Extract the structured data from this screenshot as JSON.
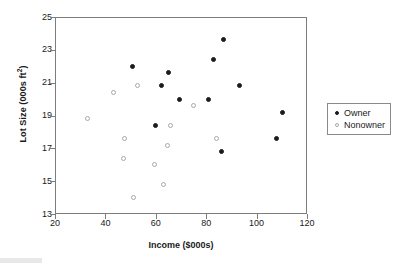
{
  "chart_data": {
    "type": "scatter",
    "title": "",
    "xlabel": "Income ($000s)",
    "ylabel": "Lot Size (000s ft²)",
    "ylabel_main": "Lot Size (000s ft",
    "ylabel_sup": "2",
    "ylabel_tail": ")",
    "xlim": [
      20,
      120
    ],
    "ylim": [
      13,
      25
    ],
    "xticks": [
      20,
      40,
      60,
      80,
      100,
      120
    ],
    "yticks": [
      13,
      15,
      17,
      19,
      21,
      23,
      25
    ],
    "grid": false,
    "legend_position": "right-outside",
    "series": [
      {
        "name": "Owner",
        "marker": "filled-circle",
        "color": "#1c1c1c",
        "points": [
          {
            "x": 50.9,
            "y": 22.0
          },
          {
            "x": 60.0,
            "y": 18.4
          },
          {
            "x": 62.3,
            "y": 20.8
          },
          {
            "x": 64.9,
            "y": 21.6
          },
          {
            "x": 69.3,
            "y": 20.0
          },
          {
            "x": 80.8,
            "y": 20.0
          },
          {
            "x": 82.9,
            "y": 22.4
          },
          {
            "x": 86.7,
            "y": 23.6
          },
          {
            "x": 85.9,
            "y": 16.8
          },
          {
            "x": 93.3,
            "y": 20.8
          },
          {
            "x": 110.1,
            "y": 19.2
          },
          {
            "x": 108.0,
            "y": 17.6
          }
        ]
      },
      {
        "name": "Nonowner",
        "marker": "open-circle",
        "color": "#a8a8a8",
        "points": [
          {
            "x": 33.0,
            "y": 18.8
          },
          {
            "x": 43.2,
            "y": 20.4
          },
          {
            "x": 52.8,
            "y": 20.8
          },
          {
            "x": 47.4,
            "y": 17.6
          },
          {
            "x": 47.2,
            "y": 16.4
          },
          {
            "x": 51.0,
            "y": 14.0
          },
          {
            "x": 59.4,
            "y": 16.0
          },
          {
            "x": 63.0,
            "y": 14.8
          },
          {
            "x": 64.8,
            "y": 17.2
          },
          {
            "x": 66.0,
            "y": 18.4
          },
          {
            "x": 75.0,
            "y": 19.6
          },
          {
            "x": 84.0,
            "y": 17.6
          }
        ]
      }
    ]
  },
  "legend": {
    "items": [
      {
        "label": "Owner",
        "marker": "filled-circle"
      },
      {
        "label": "Nonowner",
        "marker": "open-circle"
      }
    ]
  },
  "colors": {
    "owner": "#1c1c1c",
    "nonowner": "#a8a8a8",
    "axis": "#7d7d7d",
    "text": "#1a1a1a",
    "background": "#ffffff"
  }
}
